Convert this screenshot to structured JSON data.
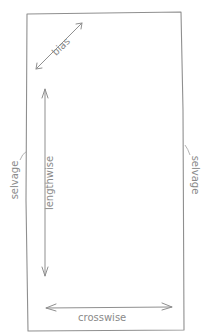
{
  "diagram": {
    "colors": {
      "line": "#8f8f8f",
      "text": "#8a8a8a",
      "background": "#ffffff"
    },
    "fabric": {
      "shape": "rectangle",
      "edges": {
        "top": "",
        "bottom": "",
        "left": "selvage",
        "right": "selvage"
      }
    },
    "labels": {
      "bias": "bias",
      "lengthwise": "lengthwise",
      "crosswise": "crosswise",
      "selvage_left": "selvage",
      "selvage_right": "selvage"
    },
    "arrows": [
      {
        "name": "bias",
        "direction": "diagonal",
        "double_headed": true
      },
      {
        "name": "lengthwise",
        "direction": "vertical",
        "double_headed": true
      },
      {
        "name": "crosswise",
        "direction": "horizontal",
        "double_headed": true
      }
    ]
  }
}
